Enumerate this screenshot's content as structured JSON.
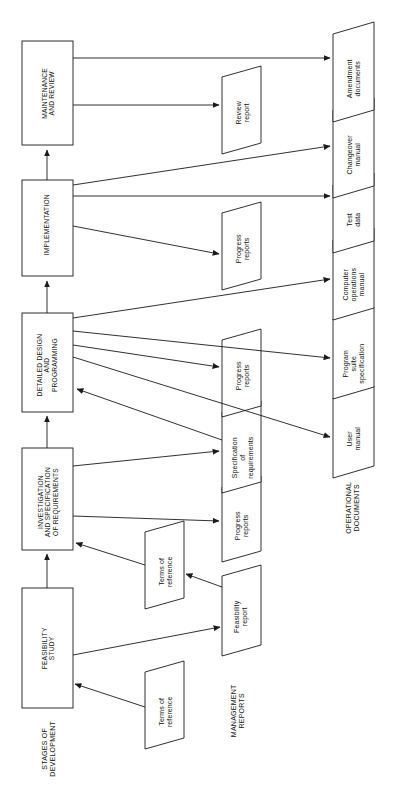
{
  "diagram": {
    "type": "flowchart",
    "orientation": "rotated-90-counterclockwise",
    "stroke_color": "#1a1a1a",
    "fill_color": "#ffffff",
    "background_color": "#ffffff"
  },
  "stages": {
    "group_label": "STAGES OF\nDEVELOPMENT",
    "group_label_line1": "STAGES OF",
    "group_label_line2": "DEVELOPMENT",
    "items": [
      {
        "id": "feasibility-study",
        "line1": "FEASIBILITY",
        "line2": "STUDY",
        "line3": "",
        "line4": ""
      },
      {
        "id": "investigation-and-specification-of-requirements",
        "line1": "INVESTIGATION",
        "line2": "AND SPECIFICATION",
        "line3": "OF REQUIREMENTS",
        "line4": ""
      },
      {
        "id": "detailed-design-and-programming",
        "line1": "DETAILED DESIGN",
        "line2": "AND",
        "line3": "PROGRAMMING",
        "line4": ""
      },
      {
        "id": "implementation",
        "line1": "IMPLEMENTATION",
        "line2": "",
        "line3": "",
        "line4": ""
      },
      {
        "id": "maintenance-and-review",
        "line1": "MAINTENANCE",
        "line2": "AND REVIEW",
        "line3": "",
        "line4": ""
      }
    ]
  },
  "management_reports": {
    "group_label_line1": "MANAGEMENT",
    "group_label_line2": "REPORTS",
    "items": [
      {
        "id": "terms-of-reference-lower",
        "line1": "Terms of",
        "line2": "reference"
      },
      {
        "id": "feasibility-report",
        "line1": "Feasibility",
        "line2": "report"
      },
      {
        "id": "terms-of-reference-upper",
        "line1": "Terms of",
        "line2": "reference"
      },
      {
        "id": "progress-reports-investigation",
        "line1": "Progress",
        "line2": "reports"
      },
      {
        "id": "specification-of-requirements",
        "line1": "Specification",
        "line2": "of",
        "line3": "requirements"
      },
      {
        "id": "progress-reports-design",
        "line1": "Progress",
        "line2": "reports"
      },
      {
        "id": "progress-reports-implementation",
        "line1": "Progress",
        "line2": "reports"
      },
      {
        "id": "review-report",
        "line1": "Review",
        "line2": "report"
      }
    ]
  },
  "operational_documents": {
    "group_label_line1": "OPERATIONAL",
    "group_label_line2": "DOCUMENTS",
    "items": [
      {
        "id": "user-manual",
        "line1": "User",
        "line2": "manual",
        "line3": ""
      },
      {
        "id": "program-suite-specification",
        "line1": "Program",
        "line2": "suite",
        "line3": "specification"
      },
      {
        "id": "computer-operations-manual",
        "line1": "Computer",
        "line2": "operations",
        "line3": "manual"
      },
      {
        "id": "test-data",
        "line1": "Test",
        "line2": "data",
        "line3": ""
      },
      {
        "id": "changeover-manual",
        "line1": "Changeover",
        "line2": "manual",
        "line3": ""
      },
      {
        "id": "amendment-documents",
        "line1": "Amendment",
        "line2": "documents",
        "line3": ""
      }
    ]
  },
  "connections": [
    {
      "from": "terms-of-reference-lower",
      "to": "feasibility-study"
    },
    {
      "from": "feasibility-study",
      "to": "feasibility-report"
    },
    {
      "from": "feasibility-report",
      "to": "terms-of-reference-upper"
    },
    {
      "from": "terms-of-reference-upper",
      "to": "investigation-and-specification-of-requirements"
    },
    {
      "from": "feasibility-study",
      "to": "investigation-and-specification-of-requirements"
    },
    {
      "from": "investigation-and-specification-of-requirements",
      "to": "progress-reports-investigation"
    },
    {
      "from": "investigation-and-specification-of-requirements",
      "to": "specification-of-requirements"
    },
    {
      "from": "specification-of-requirements",
      "to": "detailed-design-and-programming"
    },
    {
      "from": "investigation-and-specification-of-requirements",
      "to": "detailed-design-and-programming"
    },
    {
      "from": "detailed-design-and-programming",
      "to": "progress-reports-design"
    },
    {
      "from": "detailed-design-and-programming",
      "to": "user-manual"
    },
    {
      "from": "detailed-design-and-programming",
      "to": "program-suite-specification"
    },
    {
      "from": "detailed-design-and-programming",
      "to": "computer-operations-manual"
    },
    {
      "from": "detailed-design-and-programming",
      "to": "implementation"
    },
    {
      "from": "implementation",
      "to": "progress-reports-implementation"
    },
    {
      "from": "implementation",
      "to": "test-data"
    },
    {
      "from": "implementation",
      "to": "changeover-manual"
    },
    {
      "from": "implementation",
      "to": "maintenance-and-review"
    },
    {
      "from": "maintenance-and-review",
      "to": "review-report"
    },
    {
      "from": "maintenance-and-review",
      "to": "amendment-documents"
    }
  ]
}
